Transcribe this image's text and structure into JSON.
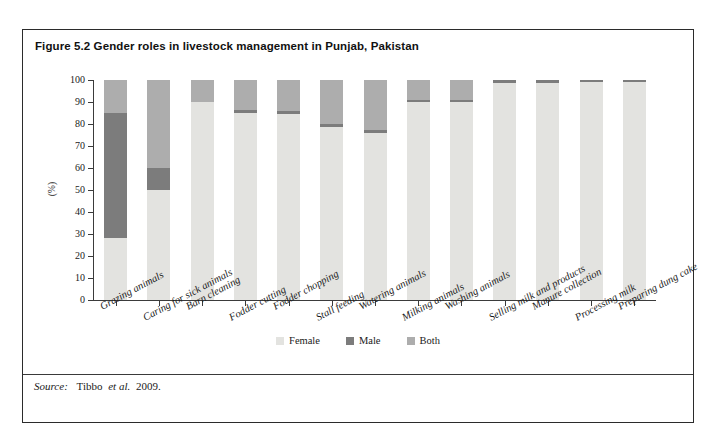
{
  "figure": {
    "title": "Figure 5.2 Gender roles in livestock management in Punjab, Pakistan",
    "source_prefix": "Source:",
    "source_author": "Tibbo",
    "source_etal": "et al.",
    "source_year": "2009."
  },
  "chart_data": {
    "type": "bar",
    "stacked": true,
    "title": "Figure 5.2 Gender roles in livestock management in Punjab, Pakistan",
    "xlabel": "",
    "ylabel": "(%)",
    "ylim": [
      0,
      100
    ],
    "yticks": [
      0,
      10,
      20,
      30,
      40,
      50,
      60,
      70,
      80,
      90,
      100
    ],
    "grid": false,
    "legend_position": "bottom",
    "categories": [
      "Grazing animals",
      "Caring for sick animals",
      "Barn cleaning",
      "Fodder cutting",
      "Fodder chopping",
      "Stall feeding",
      "Watering animals",
      "Milking animals",
      "Washing animals",
      "Selling milk and products",
      "Manure collection",
      "Processing milk",
      "Preparing dung cake"
    ],
    "series": [
      {
        "name": "Female",
        "color": "#e3e3e0",
        "values": [
          28,
          50,
          90,
          85,
          84.5,
          78.5,
          76,
          90,
          90,
          98.5,
          98.5,
          99,
          99
        ]
      },
      {
        "name": "Male",
        "color": "#7c7c7c",
        "values": [
          57,
          10,
          0,
          1.5,
          1.5,
          1.5,
          1.5,
          1,
          1,
          1.5,
          1.5,
          1,
          1
        ]
      },
      {
        "name": "Both",
        "color": "#adadad",
        "values": [
          15,
          40,
          10,
          13.5,
          14,
          20,
          22.5,
          9,
          9,
          0,
          0,
          0,
          0
        ]
      }
    ]
  },
  "legend": {
    "items": [
      {
        "label": "Female",
        "color": "#e3e3e0"
      },
      {
        "label": "Male",
        "color": "#7c7c7c"
      },
      {
        "label": "Both",
        "color": "#adadad"
      }
    ]
  }
}
